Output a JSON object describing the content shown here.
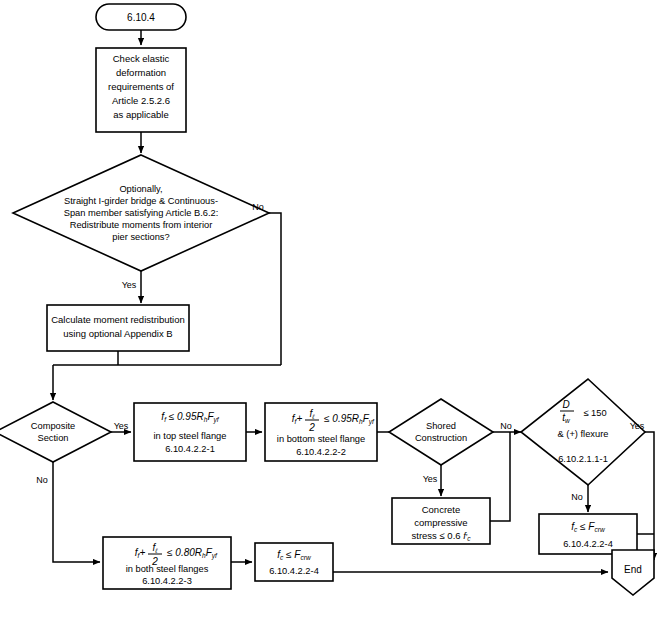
{
  "figure": {
    "start_label": "6.10.4",
    "end_label": "End"
  },
  "nodes": {
    "check_elastic": {
      "lines": [
        "Check elastic",
        "deformation",
        "requirements of",
        "Article 2.5.2.6",
        "as applicable"
      ]
    },
    "redistribute_decision": {
      "lines": [
        "Optionally,",
        "Straight I-girder bridge & Continuous-",
        "Span member satisfying Article B.6.2:",
        "Redistribute moments from interior",
        "pier sections?"
      ]
    },
    "calc_redistribution": {
      "lines": [
        "Calculate moment redistribution",
        "using optional Appendix B"
      ]
    },
    "composite_section": {
      "lines": [
        "Composite",
        "Section"
      ]
    },
    "top_flange_check": {
      "formula": "f_f ≤ 0.95 R_h F_yf",
      "line2": "in top steel flange",
      "reference": "6.10.4.2.2-1"
    },
    "bottom_flange_check": {
      "formula": "f_f + f_l/2 ≤ 0.95 R_h F_yf",
      "line2": "in bottom steel flange",
      "reference": "6.10.4.2.2-2"
    },
    "shored_construction": {
      "lines": [
        "Shored",
        "Construction"
      ]
    },
    "concrete_stress": {
      "lines": [
        "Concrete",
        "compressive",
        "stress ≤ 0.6 f'c"
      ]
    },
    "web_slenderness": {
      "formula": "D/t_w ≤ 150",
      "line2": "& (+) flexure",
      "reference": "6.10.2.1.1-1",
      "limit_value": "150"
    },
    "fc_check_right": {
      "formula": "f_c ≤ F_crw",
      "reference": "6.10.4.2.2-4"
    },
    "both_flanges_check": {
      "formula": "f_f + f_l/2 ≤ 0.80 R_h F_yf",
      "line2": "in both steel flanges",
      "reference": "6.10.4.2.2-3"
    },
    "fc_check_bottom": {
      "formula": "f_c ≤ F_crw",
      "reference": "6.10.4.2.2-4"
    }
  },
  "branch_labels": {
    "redistribute_no": "No",
    "redistribute_yes": "Yes",
    "composite_yes": "Yes",
    "composite_no": "No",
    "shored_yes": "Yes",
    "shored_no": "No",
    "web_yes": "Yes",
    "web_no": "No"
  },
  "symbols": {
    "f": "f",
    "sub_f": "f",
    "sub_l": "ℓ",
    "sub_c": "c",
    "sub_yf": "yf",
    "sub_h": "h",
    "sub_w": "w",
    "sub_crw": "crw",
    "R": "R",
    "F": "F",
    "D": "D",
    "t": "t",
    "leq": "≤",
    "two": "2",
    "coef_095": "0.95",
    "coef_080": "0.80",
    "coef_06": "0.6",
    "plus": "+",
    "fprime_c": "f′c"
  },
  "colors": {
    "stroke": "#000000",
    "fill": "#ffffff",
    "background": "#ffffff"
  }
}
